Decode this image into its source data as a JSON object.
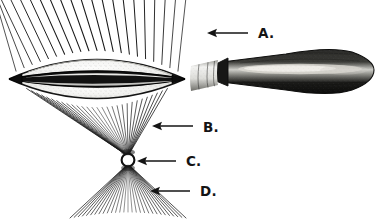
{
  "figure": {
    "background_color": "#ffffff",
    "ink_color": "#1a1a1a",
    "width": 384,
    "height": 221
  },
  "labels": [
    {
      "id": "A",
      "text": "A.",
      "meaning": "incident parallel sun rays above the lens",
      "text_x": 258,
      "text_y": 38,
      "arrow_from_x": 248,
      "arrow_from_y": 33,
      "arrow_to_x": 207,
      "arrow_to_y": 33
    },
    {
      "id": "B",
      "text": "B.",
      "meaning": "converging refracted ray cone below the lens",
      "text_x": 203,
      "text_y": 132,
      "arrow_from_x": 193,
      "arrow_from_y": 126,
      "arrow_to_x": 152,
      "arrow_to_y": 126
    },
    {
      "id": "C",
      "text": "C.",
      "meaning": "the focus or burning point",
      "text_x": 186,
      "text_y": 166,
      "arrow_from_x": 176,
      "arrow_from_y": 161,
      "arrow_to_x": 137,
      "arrow_to_y": 161
    },
    {
      "id": "D",
      "text": "D.",
      "meaning": "diverging rays beyond the focus",
      "text_x": 200,
      "text_y": 196,
      "arrow_from_x": 190,
      "arrow_from_y": 191,
      "arrow_to_x": 150,
      "arrow_to_y": 191
    }
  ],
  "lens": {
    "name": "double-convex burning glass",
    "center_x": 97,
    "center_y": 79,
    "half_width": 88,
    "half_height": 27,
    "rim_band_color": "#111111",
    "glass_fill": "#f2f2f0"
  },
  "handle": {
    "name": "turned wooden handle",
    "ferrule_color": "#e8e8e6",
    "wood_color": "#1c1c1c",
    "highlight_color": "#d9d9d6",
    "start_x": 186,
    "end_x": 374
  },
  "rays": {
    "incident": {
      "name": "incident-sun-rays",
      "count": 21,
      "label_ref": "A"
    },
    "converging": {
      "name": "converging-ray-cone",
      "count": 29,
      "label_ref": "B"
    },
    "focus": {
      "name": "focal-point",
      "x": 128,
      "y": 160,
      "radius": 6,
      "label_ref": "C"
    },
    "diverging": {
      "name": "diverging-ray-cone",
      "count": 29,
      "label_ref": "D"
    }
  }
}
